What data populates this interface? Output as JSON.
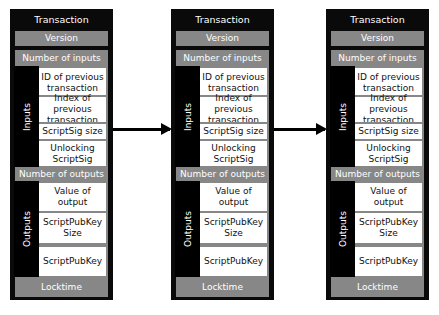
{
  "transactions": [
    {
      "title": "Transaction",
      "version": "Version",
      "number_of_inputs": "Number of inputs",
      "inputs_label": "Inputs",
      "input_fields": [
        "ID of previous transaction",
        "Index of previous transaction",
        "ScriptSig size",
        "Unlocking ScriptSig"
      ],
      "number_of_outputs": "Number of outputs",
      "outputs_label": "Outputs",
      "output_fields": [
        "Value of output",
        "ScriptPubKey Size",
        "ScriptPubKey"
      ],
      "locktime": "Locktime"
    },
    {
      "title": "Transaction",
      "version": "Version",
      "number_of_inputs": "Number of inputs",
      "inputs_label": "Inputs",
      "input_fields": [
        "ID of previous transaction",
        "Index of previous transaction",
        "ScriptSig size",
        "Unlocking ScriptSig"
      ],
      "number_of_outputs": "Number of outputs",
      "outputs_label": "Outputs",
      "output_fields": [
        "Value of output",
        "ScriptPubKey Size",
        "ScriptPubKey"
      ],
      "locktime": "Locktime"
    },
    {
      "title": "Transaction",
      "version": "Version",
      "number_of_inputs": "Number of inputs",
      "inputs_label": "Inputs",
      "input_fields": [
        "ID of previous transaction",
        "Index of previous transaction",
        "ScriptSig size",
        "Unlocking ScriptSig"
      ],
      "number_of_outputs": "Number of outputs",
      "outputs_label": "Outputs",
      "output_fields": [
        "Value of output",
        "ScriptPubKey Size",
        "ScriptPubKey"
      ],
      "locktime": "Locktime"
    }
  ],
  "arrows": [
    {
      "from": 0,
      "to": 1
    },
    {
      "from": 1,
      "to": 2
    }
  ],
  "colors": {
    "frame": "#0a0a0a",
    "band": "#878787",
    "field": "#ffffff",
    "arrow": "#000000"
  }
}
